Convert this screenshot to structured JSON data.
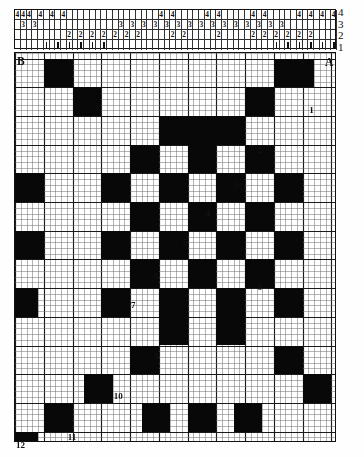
{
  "diagram": {
    "type": "weaving-draft",
    "corner_labels": {
      "top_left": "B",
      "top_right": "A",
      "bottom_left": "12"
    },
    "shaft_axis_labels": [
      "4",
      "3",
      "2",
      "1"
    ],
    "grid": {
      "columns": 56,
      "rows": 62,
      "cell_px": 5.75,
      "heavy_every": 5
    }
  },
  "threading": {
    "rows": [
      {
        "shaft": "4",
        "label": "4",
        "entries": [
          {
            "col": 0,
            "text": "4"
          },
          {
            "col": 1,
            "text": "4"
          },
          {
            "col": 2,
            "text": "4"
          },
          {
            "col": 4,
            "text": "4"
          },
          {
            "col": 6,
            "text": "4"
          },
          {
            "col": 8,
            "text": "4"
          },
          {
            "col": 25,
            "text": "4"
          },
          {
            "col": 27,
            "text": "4"
          },
          {
            "col": 33,
            "text": "4"
          },
          {
            "col": 35,
            "text": "4"
          },
          {
            "col": 41,
            "text": "4"
          },
          {
            "col": 43,
            "text": "4"
          },
          {
            "col": 49,
            "text": "4"
          },
          {
            "col": 51,
            "text": "4"
          },
          {
            "col": 53,
            "text": "4"
          },
          {
            "col": 55,
            "text": "4"
          }
        ]
      },
      {
        "shaft": "3",
        "label": "3",
        "entries": [
          {
            "col": 1,
            "text": "3"
          },
          {
            "col": 3,
            "text": "3"
          },
          {
            "col": 18,
            "text": "3"
          },
          {
            "col": 20,
            "text": "3"
          },
          {
            "col": 22,
            "text": "3"
          },
          {
            "col": 24,
            "text": "3"
          },
          {
            "col": 26,
            "text": "3"
          },
          {
            "col": 28,
            "text": "3"
          },
          {
            "col": 30,
            "text": "3"
          },
          {
            "col": 32,
            "text": "3"
          },
          {
            "col": 34,
            "text": "3"
          },
          {
            "col": 36,
            "text": "3"
          },
          {
            "col": 38,
            "text": "3"
          },
          {
            "col": 40,
            "text": "3"
          },
          {
            "col": 42,
            "text": "3"
          },
          {
            "col": 44,
            "text": "3"
          },
          {
            "col": 46,
            "text": "3"
          }
        ]
      },
      {
        "shaft": "2",
        "label": "2",
        "entries": [
          {
            "col": 9,
            "text": "2"
          },
          {
            "col": 11,
            "text": "2"
          },
          {
            "col": 13,
            "text": "2"
          },
          {
            "col": 15,
            "text": "2"
          },
          {
            "col": 17,
            "text": "2"
          },
          {
            "col": 19,
            "text": "2"
          },
          {
            "col": 21,
            "text": "2"
          },
          {
            "col": 27,
            "text": "2"
          },
          {
            "col": 29,
            "text": "2"
          },
          {
            "col": 35,
            "text": "2"
          },
          {
            "col": 41,
            "text": "2"
          },
          {
            "col": 43,
            "text": "2"
          },
          {
            "col": 45,
            "text": "2"
          },
          {
            "col": 47,
            "text": "2"
          },
          {
            "col": 49,
            "text": "2"
          },
          {
            "col": 51,
            "text": "2"
          }
        ]
      },
      {
        "shaft": "1",
        "label": "1",
        "entries": [
          {
            "col": 5,
            "text": "|"
          },
          {
            "col": 7,
            "text": "|"
          },
          {
            "col": 9,
            "text": "|"
          },
          {
            "col": 11,
            "text": "|"
          },
          {
            "col": 13,
            "text": "|"
          },
          {
            "col": 15,
            "text": "|"
          },
          {
            "col": 45,
            "text": "|"
          },
          {
            "col": 47,
            "text": "|"
          },
          {
            "col": 49,
            "text": "|"
          },
          {
            "col": 51,
            "text": "|"
          },
          {
            "col": 53,
            "text": "|"
          },
          {
            "col": 55,
            "text": "|"
          }
        ]
      }
    ]
  },
  "markers": [
    {
      "label": "1",
      "col": 51,
      "row": 9
    },
    {
      "label": "2",
      "col": 42,
      "row": 16
    },
    {
      "label": "3",
      "col": 38,
      "row": 22
    },
    {
      "label": "4",
      "col": 33,
      "row": 27
    },
    {
      "label": "5",
      "col": 29,
      "row": 32
    },
    {
      "label": "6",
      "col": 24,
      "row": 38
    },
    {
      "label": "7",
      "col": 20,
      "row": 43
    },
    {
      "label": "8",
      "col": 42,
      "row": 40
    },
    {
      "label": "9",
      "col": 24,
      "row": 52
    },
    {
      "label": "10",
      "col": 17,
      "row": 59
    },
    {
      "label": "11",
      "col": 9,
      "row": 66
    },
    {
      "label": "12",
      "col": 1,
      "row": 70
    }
  ],
  "blocks": [
    {
      "c": 5,
      "r": 1,
      "w": 5,
      "h": 5
    },
    {
      "c": 10,
      "r": 6,
      "w": 5,
      "h": 5
    },
    {
      "c": 25,
      "r": 11,
      "w": 5,
      "h": 5
    },
    {
      "c": 45,
      "r": 1,
      "w": 7,
      "h": 5
    },
    {
      "c": 40,
      "r": 6,
      "w": 5,
      "h": 5
    },
    {
      "c": 35,
      "r": 11,
      "w": 5,
      "h": 5
    },
    {
      "c": 30,
      "r": 11,
      "w": 5,
      "h": 5
    },
    {
      "c": 0,
      "r": 21,
      "w": 5,
      "h": 5
    },
    {
      "c": 0,
      "r": 31,
      "w": 5,
      "h": 5
    },
    {
      "c": 0,
      "r": 41,
      "w": 4,
      "h": 5
    },
    {
      "c": 20,
      "r": 16,
      "w": 5,
      "h": 5
    },
    {
      "c": 30,
      "r": 16,
      "w": 5,
      "h": 5
    },
    {
      "c": 40,
      "r": 16,
      "w": 5,
      "h": 5
    },
    {
      "c": 15,
      "r": 21,
      "w": 5,
      "h": 5
    },
    {
      "c": 25,
      "r": 21,
      "w": 5,
      "h": 5
    },
    {
      "c": 35,
      "r": 21,
      "w": 5,
      "h": 5
    },
    {
      "c": 45,
      "r": 21,
      "w": 5,
      "h": 5
    },
    {
      "c": 20,
      "r": 26,
      "w": 5,
      "h": 5
    },
    {
      "c": 30,
      "r": 26,
      "w": 5,
      "h": 5
    },
    {
      "c": 40,
      "r": 26,
      "w": 5,
      "h": 5
    },
    {
      "c": 15,
      "r": 31,
      "w": 5,
      "h": 5
    },
    {
      "c": 25,
      "r": 31,
      "w": 5,
      "h": 5
    },
    {
      "c": 35,
      "r": 31,
      "w": 5,
      "h": 5
    },
    {
      "c": 45,
      "r": 31,
      "w": 5,
      "h": 5
    },
    {
      "c": 20,
      "r": 36,
      "w": 5,
      "h": 5
    },
    {
      "c": 30,
      "r": 36,
      "w": 5,
      "h": 5
    },
    {
      "c": 40,
      "r": 36,
      "w": 5,
      "h": 5
    },
    {
      "c": 25,
      "r": 41,
      "w": 5,
      "h": 5
    },
    {
      "c": 35,
      "r": 41,
      "w": 5,
      "h": 5
    },
    {
      "c": 15,
      "r": 41,
      "w": 5,
      "h": 5
    },
    {
      "c": 45,
      "r": 41,
      "w": 5,
      "h": 5
    },
    {
      "c": 25,
      "r": 46,
      "w": 5,
      "h": 5
    },
    {
      "c": 35,
      "r": 46,
      "w": 5,
      "h": 5
    },
    {
      "c": 20,
      "r": 51,
      "w": 5,
      "h": 5
    },
    {
      "c": 45,
      "r": 51,
      "w": 5,
      "h": 5
    },
    {
      "c": 12,
      "r": 56,
      "w": 5,
      "h": 5
    },
    {
      "c": 50,
      "r": 56,
      "w": 5,
      "h": 5
    },
    {
      "c": 5,
      "r": 61,
      "w": 5,
      "h": 5
    },
    {
      "c": 22,
      "r": 61,
      "w": 5,
      "h": 5
    },
    {
      "c": 30,
      "r": 61,
      "w": 5,
      "h": 5
    },
    {
      "c": 38,
      "r": 61,
      "w": 5,
      "h": 5
    },
    {
      "c": 0,
      "r": 66,
      "w": 4,
      "h": 5
    }
  ]
}
